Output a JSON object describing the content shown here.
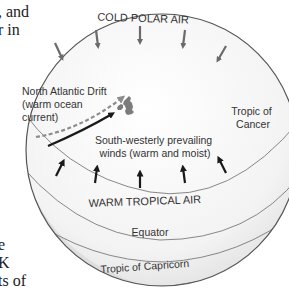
{
  "diagram": {
    "title_label": "COLD POLAR AIR",
    "bottom_air_label": "WARM TROPICAL AIR",
    "current_label_line1": "North Atlantic Drift",
    "current_label_line2": "(warm ocean",
    "current_label_line3": "current)",
    "winds_label_line1": "South-westerly prevailing",
    "winds_label_line2": "winds (warm and moist)",
    "tropic_cancer_line1": "Tropic of",
    "tropic_cancer_line2": "Cancer",
    "equator_label": "Equator",
    "tropic_capricorn_label": "Tropic of Capricorn",
    "colors": {
      "globe_fill": "#f4f4f4",
      "globe_edge": "#555555",
      "shadow_band": "#d9d9d9",
      "latitude_line": "#7a7a7a",
      "text": "#333333",
      "cold_arrow": "#6b6b6b",
      "warm_arrow": "#1a1a1a",
      "current_dashed": "#8c8c8c",
      "landmass": "#7c7c7c"
    }
  },
  "side_text": {
    "top_lines": [
      ", and",
      "r in"
    ],
    "bottom_lines": [
      "e",
      "K",
      "ts of"
    ]
  }
}
